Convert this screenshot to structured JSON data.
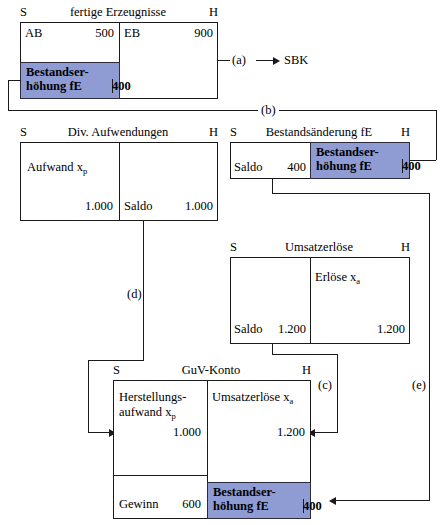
{
  "diagram": {
    "title_hidden": "",
    "accounts": [
      {
        "id": "fertige-erzeugnisse",
        "left_marker": "S",
        "title": "fertige Erzeugnisse",
        "right_marker": "H",
        "rows": [
          {
            "label": "AB",
            "amount": "500",
            "side": "debit"
          },
          {
            "label": "EB",
            "amount": "900",
            "side": "credit"
          }
        ],
        "highlight": {
          "line1": "Bestandser-",
          "line2": "höhung fE",
          "amount": "400"
        }
      },
      {
        "id": "div-aufwendungen",
        "left_marker": "S",
        "title": "Div. Aufwendungen",
        "right_marker": "H",
        "rows": [
          {
            "label": "Aufwand x",
            "sub": "p",
            "amount": "1.000",
            "side": "debit"
          },
          {
            "label": "Saldo",
            "amount": "1.000",
            "side": "credit"
          }
        ]
      },
      {
        "id": "bestandsaenderung-fe",
        "left_marker": "S",
        "title": "Bestandsänderung fE",
        "right_marker": "H",
        "rows": [
          {
            "label": "Saldo",
            "amount": "400",
            "side": "debit"
          }
        ],
        "highlight": {
          "line1": "Bestandser-",
          "line2": "höhung fE",
          "amount": "400"
        }
      },
      {
        "id": "umsatzerloese",
        "left_marker": "S",
        "title": "Umsatzerlöse",
        "right_marker": "H",
        "rows": [
          {
            "label": "Saldo",
            "amount": "1.200",
            "side": "debit"
          },
          {
            "label": "Erlöse x",
            "sub": "a",
            "amount": "1.200",
            "side": "credit"
          }
        ]
      },
      {
        "id": "guv-konto",
        "left_marker": "S",
        "title": "GuV-Konto",
        "right_marker": "H",
        "rows": [
          {
            "label": "Herstellungs-",
            "label2": "aufwand x",
            "sub": "p",
            "amount": "1.000",
            "side": "debit"
          },
          {
            "label": "Umsatzerlöse x",
            "sub": "a",
            "amount": "1.200",
            "side": "credit"
          },
          {
            "label": "Gewinn",
            "amount": "600",
            "side": "debit"
          }
        ],
        "highlight": {
          "line1": "Bestandser-",
          "line2": "höhung fE",
          "amount": "400"
        }
      }
    ],
    "connectors": [
      {
        "id": "a",
        "label": "(a)",
        "target": "SBK"
      },
      {
        "id": "b",
        "label": "(b)"
      },
      {
        "id": "c",
        "label": "(c)"
      },
      {
        "id": "d",
        "label": "(d)"
      },
      {
        "id": "e",
        "label": "(e)"
      }
    ],
    "colors": {
      "highlight_fill": "#8f9cd4",
      "line": "#1a1a1a",
      "background": "#ffffff"
    }
  }
}
